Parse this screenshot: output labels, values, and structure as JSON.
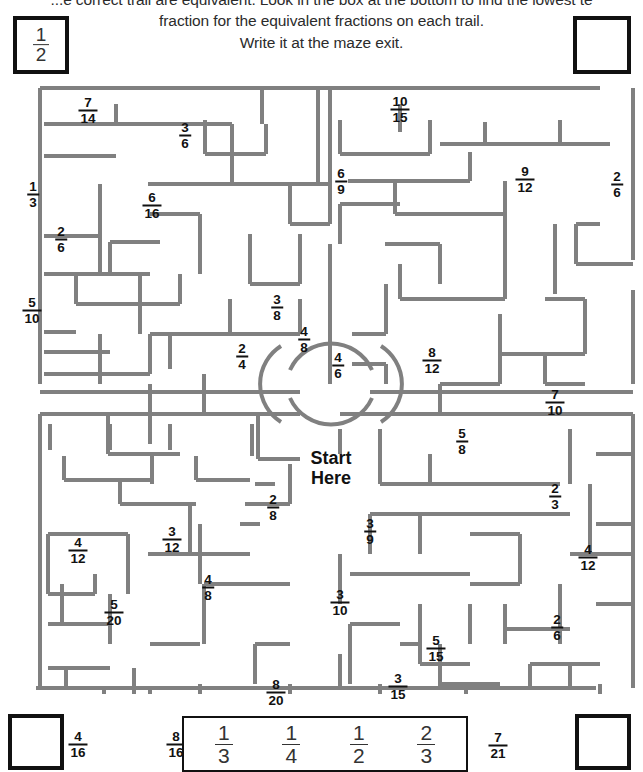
{
  "instructions": {
    "line1": "...e correct trail are equivalent. Look in the box at the bottom to find the lowest te",
    "line2": "fraction for the equivalent fractions on each trail.",
    "line3": "Write it at the maze exit."
  },
  "key_box": {
    "numerator": "1",
    "denominator": "2"
  },
  "empty_boxes": {
    "top_right": "",
    "bottom_left": "",
    "bottom_right": ""
  },
  "start_marker": {
    "line1": "Start",
    "line2": "Here"
  },
  "answer_bank": {
    "options": [
      {
        "numerator": "1",
        "denominator": "3"
      },
      {
        "numerator": "1",
        "denominator": "4"
      },
      {
        "numerator": "1",
        "denominator": "2"
      },
      {
        "numerator": "2",
        "denominator": "3"
      }
    ]
  },
  "colors": {
    "wall": "#808080",
    "border": "#111111",
    "text": "#1a1a1a"
  },
  "maze_fractions": [
    {
      "numerator": "7",
      "denominator": "14",
      "x": 88,
      "y": 26,
      "quadrant": "top-left"
    },
    {
      "numerator": "3",
      "denominator": "6",
      "x": 185,
      "y": 51,
      "quadrant": "top-left"
    },
    {
      "numerator": "1",
      "denominator": "3",
      "x": 33,
      "y": 110,
      "quadrant": "top-left"
    },
    {
      "numerator": "6",
      "denominator": "16",
      "x": 152,
      "y": 121,
      "quadrant": "top-left"
    },
    {
      "numerator": "2",
      "denominator": "6",
      "x": 61,
      "y": 155,
      "quadrant": "top-left"
    },
    {
      "numerator": "4",
      "denominator": "8",
      "x": 304,
      "y": 255,
      "quadrant": "top-left"
    },
    {
      "numerator": "5",
      "denominator": "10",
      "x": 32,
      "y": 226,
      "quadrant": "top-left"
    },
    {
      "numerator": "3",
      "denominator": "8",
      "x": 277,
      "y": 223,
      "quadrant": "top-left"
    },
    {
      "numerator": "2",
      "denominator": "4",
      "x": 242,
      "y": 272,
      "quadrant": "top-left"
    },
    {
      "numerator": "10",
      "denominator": "15",
      "x": 400,
      "y": 25,
      "quadrant": "top-right"
    },
    {
      "numerator": "6",
      "denominator": "9",
      "x": 341,
      "y": 97,
      "quadrant": "top-right"
    },
    {
      "numerator": "9",
      "denominator": "12",
      "x": 525,
      "y": 95,
      "quadrant": "top-right"
    },
    {
      "numerator": "2",
      "denominator": "6",
      "x": 617,
      "y": 100,
      "quadrant": "top-right"
    },
    {
      "numerator": "4",
      "denominator": "6",
      "x": 338,
      "y": 281,
      "quadrant": "top-right"
    },
    {
      "numerator": "8",
      "denominator": "12",
      "x": 432,
      "y": 276,
      "quadrant": "top-right"
    },
    {
      "numerator": "7",
      "denominator": "10",
      "x": 555,
      "y": 318,
      "quadrant": "top-right"
    },
    {
      "numerator": "5",
      "denominator": "8",
      "x": 462,
      "y": 357,
      "quadrant": "top-right"
    },
    {
      "numerator": "2",
      "denominator": "8",
      "x": 273,
      "y": 423,
      "quadrant": "bottom-left"
    },
    {
      "numerator": "3",
      "denominator": "12",
      "x": 172,
      "y": 455,
      "quadrant": "bottom-left"
    },
    {
      "numerator": "4",
      "denominator": "12",
      "x": 78,
      "y": 466,
      "quadrant": "bottom-left"
    },
    {
      "numerator": "4",
      "denominator": "8",
      "x": 208,
      "y": 503,
      "quadrant": "bottom-left"
    },
    {
      "numerator": "5",
      "denominator": "20",
      "x": 114,
      "y": 528,
      "quadrant": "bottom-left"
    },
    {
      "numerator": "8",
      "denominator": "20",
      "x": 276,
      "y": 608,
      "quadrant": "bottom-left"
    },
    {
      "numerator": "4",
      "denominator": "16",
      "x": 78,
      "y": 660,
      "quadrant": "bottom-left"
    },
    {
      "numerator": "8",
      "denominator": "16",
      "x": 176,
      "y": 660,
      "quadrant": "bottom-left"
    },
    {
      "numerator": "2",
      "denominator": "3",
      "x": 555,
      "y": 412,
      "quadrant": "bottom-right"
    },
    {
      "numerator": "3",
      "denominator": "9",
      "x": 370,
      "y": 447,
      "quadrant": "bottom-right"
    },
    {
      "numerator": "4",
      "denominator": "12",
      "x": 588,
      "y": 473,
      "quadrant": "bottom-right"
    },
    {
      "numerator": "3",
      "denominator": "10",
      "x": 340,
      "y": 518,
      "quadrant": "bottom-right"
    },
    {
      "numerator": "2",
      "denominator": "6",
      "x": 557,
      "y": 543,
      "quadrant": "bottom-right"
    },
    {
      "numerator": "5",
      "denominator": "15",
      "x": 436,
      "y": 564,
      "quadrant": "bottom-right"
    },
    {
      "numerator": "3",
      "denominator": "15",
      "x": 398,
      "y": 602,
      "quadrant": "bottom-right"
    },
    {
      "numerator": "9",
      "denominator": "18",
      "x": 340,
      "y": 661,
      "quadrant": "bottom-right"
    },
    {
      "numerator": "7",
      "denominator": "21",
      "x": 498,
      "y": 661,
      "quadrant": "bottom-right"
    }
  ],
  "maze_walls": {
    "stroke_width": 4,
    "segments": [
      [
        40,
        4,
        40,
        300
      ],
      [
        40,
        330,
        40,
        604
      ],
      [
        40,
        4,
        600,
        4
      ],
      [
        36,
        604,
        596,
        604
      ],
      [
        633,
        4,
        633,
        176
      ],
      [
        633,
        206,
        633,
        300
      ],
      [
        633,
        330,
        633,
        604
      ],
      [
        40,
        308,
        300,
        308
      ],
      [
        370,
        308,
        633,
        308
      ],
      [
        44,
        40,
        232,
        40
      ],
      [
        44,
        72,
        116,
        72
      ],
      [
        232,
        40,
        232,
        100
      ],
      [
        148,
        100,
        330,
        100
      ],
      [
        116,
        40,
        116,
        20
      ],
      [
        318,
        4,
        318,
        100
      ],
      [
        330,
        4,
        330,
        48
      ],
      [
        400,
        20,
        400,
        48
      ],
      [
        100,
        100,
        100,
        190
      ],
      [
        262,
        4,
        262,
        40
      ],
      [
        266,
        40,
        266,
        70
      ],
      [
        205,
        70,
        266,
        70
      ],
      [
        205,
        36,
        205,
        70
      ],
      [
        340,
        36,
        340,
        70
      ],
      [
        340,
        70,
        430,
        70
      ],
      [
        430,
        36,
        430,
        70
      ],
      [
        485,
        38,
        485,
        60
      ],
      [
        440,
        60,
        560,
        60
      ],
      [
        560,
        36,
        560,
        60
      ],
      [
        560,
        60,
        610,
        60
      ],
      [
        200,
        130,
        200,
        190
      ],
      [
        150,
        130,
        200,
        130
      ],
      [
        44,
        152,
        100,
        152
      ],
      [
        44,
        190,
        150,
        190
      ],
      [
        110,
        158,
        160,
        158
      ],
      [
        110,
        158,
        110,
        190
      ],
      [
        76,
        190,
        76,
        220
      ],
      [
        76,
        220,
        180,
        220
      ],
      [
        180,
        190,
        180,
        220
      ],
      [
        140,
        190,
        140,
        250
      ],
      [
        150,
        250,
        230,
        250
      ],
      [
        44,
        248,
        76,
        248
      ],
      [
        44,
        290,
        150,
        290
      ],
      [
        150,
        250,
        150,
        290
      ],
      [
        230,
        215,
        230,
        250
      ],
      [
        230,
        250,
        300,
        250
      ],
      [
        170,
        250,
        170,
        285
      ],
      [
        100,
        250,
        100,
        300
      ],
      [
        300,
        215,
        300,
        250
      ],
      [
        44,
        268,
        110,
        268
      ],
      [
        44,
        330,
        150,
        330
      ],
      [
        150,
        300,
        150,
        360
      ],
      [
        204,
        290,
        204,
        330
      ],
      [
        204,
        330,
        300,
        330
      ],
      [
        258,
        330,
        258,
        375
      ],
      [
        258,
        375,
        300,
        375
      ],
      [
        108,
        330,
        108,
        370
      ],
      [
        108,
        370,
        180,
        370
      ],
      [
        300,
        150,
        300,
        200
      ],
      [
        250,
        200,
        300,
        200
      ],
      [
        250,
        150,
        250,
        200
      ],
      [
        330,
        48,
        330,
        140
      ],
      [
        330,
        140,
        290,
        140
      ],
      [
        290,
        100,
        290,
        140
      ],
      [
        348,
        97,
        470,
        97
      ],
      [
        470,
        68,
        470,
        97
      ],
      [
        395,
        97,
        395,
        130
      ],
      [
        395,
        130,
        505,
        130
      ],
      [
        505,
        97,
        505,
        130
      ],
      [
        505,
        130,
        505,
        215
      ],
      [
        400,
        215,
        505,
        215
      ],
      [
        400,
        180,
        400,
        215
      ],
      [
        440,
        160,
        440,
        200
      ],
      [
        340,
        120,
        400,
        120
      ],
      [
        340,
        120,
        340,
        160
      ],
      [
        385,
        160,
        440,
        160
      ],
      [
        330,
        160,
        330,
        250
      ],
      [
        352,
        250,
        386,
        250
      ],
      [
        386,
        200,
        386,
        250
      ],
      [
        330,
        250,
        330,
        300
      ],
      [
        386,
        280,
        386,
        300
      ],
      [
        352,
        280,
        386,
        280
      ],
      [
        500,
        230,
        500,
        300
      ],
      [
        440,
        300,
        500,
        300
      ],
      [
        440,
        300,
        440,
        330
      ],
      [
        555,
        140,
        555,
        210
      ],
      [
        576,
        140,
        600,
        140
      ],
      [
        576,
        140,
        576,
        180
      ],
      [
        600,
        180,
        633,
        180
      ],
      [
        576,
        180,
        633,
        180
      ],
      [
        545,
        215,
        585,
        215
      ],
      [
        585,
        215,
        585,
        270
      ],
      [
        500,
        270,
        585,
        270
      ],
      [
        545,
        300,
        585,
        300
      ],
      [
        545,
        270,
        545,
        300
      ],
      [
        40,
        330,
        300,
        330
      ],
      [
        50,
        340,
        50,
        366
      ],
      [
        110,
        340,
        110,
        366
      ],
      [
        170,
        340,
        170,
        366
      ],
      [
        64,
        372,
        64,
        396
      ],
      [
        64,
        396,
        150,
        396
      ],
      [
        152,
        372,
        152,
        400
      ],
      [
        196,
        372,
        196,
        396
      ],
      [
        196,
        396,
        250,
        396
      ],
      [
        120,
        420,
        196,
        420
      ],
      [
        120,
        396,
        120,
        420
      ],
      [
        252,
        340,
        252,
        372
      ],
      [
        190,
        420,
        190,
        470
      ],
      [
        128,
        450,
        128,
        510
      ],
      [
        48,
        450,
        128,
        450
      ],
      [
        48,
        450,
        48,
        510
      ],
      [
        48,
        510,
        95,
        510
      ],
      [
        95,
        490,
        95,
        510
      ],
      [
        190,
        470,
        250,
        470
      ],
      [
        148,
        470,
        190,
        470
      ],
      [
        62,
        500,
        62,
        540
      ],
      [
        48,
        540,
        110,
        540
      ],
      [
        110,
        510,
        110,
        560
      ],
      [
        240,
        440,
        260,
        440
      ],
      [
        200,
        440,
        200,
        500
      ],
      [
        255,
        400,
        275,
        400
      ],
      [
        245,
        420,
        290,
        420
      ],
      [
        290,
        380,
        290,
        420
      ],
      [
        204,
        500,
        290,
        500
      ],
      [
        204,
        500,
        204,
        560
      ],
      [
        255,
        560,
        290,
        560
      ],
      [
        255,
        560,
        255,
        600
      ],
      [
        150,
        560,
        200,
        560
      ],
      [
        48,
        584,
        110,
        584
      ],
      [
        66,
        584,
        66,
        604
      ],
      [
        134,
        584,
        134,
        620
      ],
      [
        134,
        620,
        200,
        620
      ],
      [
        200,
        600,
        200,
        640
      ],
      [
        48,
        625,
        100,
        625
      ],
      [
        156,
        640,
        200,
        640
      ],
      [
        104,
        640,
        104,
        604
      ],
      [
        245,
        630,
        300,
        630
      ],
      [
        150,
        640,
        150,
        604
      ],
      [
        290,
        600,
        290,
        640
      ],
      [
        340,
        330,
        633,
        330
      ],
      [
        340,
        345,
        340,
        370
      ],
      [
        380,
        345,
        380,
        400
      ],
      [
        380,
        400,
        560,
        400
      ],
      [
        430,
        370,
        430,
        400
      ],
      [
        570,
        345,
        570,
        400
      ],
      [
        596,
        370,
        633,
        370
      ],
      [
        370,
        430,
        570,
        430
      ],
      [
        370,
        430,
        370,
        470
      ],
      [
        590,
        400,
        590,
        470
      ],
      [
        420,
        430,
        420,
        470
      ],
      [
        470,
        450,
        520,
        450
      ],
      [
        520,
        450,
        520,
        500
      ],
      [
        470,
        500,
        520,
        500
      ],
      [
        430,
        490,
        470,
        490
      ],
      [
        340,
        470,
        340,
        520
      ],
      [
        350,
        490,
        430,
        490
      ],
      [
        596,
        440,
        633,
        440
      ],
      [
        570,
        470,
        633,
        470
      ],
      [
        420,
        520,
        420,
        580
      ],
      [
        470,
        520,
        470,
        560
      ],
      [
        505,
        545,
        570,
        545
      ],
      [
        505,
        520,
        505,
        560
      ],
      [
        560,
        500,
        560,
        560
      ],
      [
        420,
        580,
        470,
        580
      ],
      [
        400,
        560,
        420,
        560
      ],
      [
        350,
        540,
        400,
        540
      ],
      [
        350,
        540,
        350,
        600
      ],
      [
        440,
        600,
        500,
        600
      ],
      [
        440,
        560,
        440,
        604
      ],
      [
        530,
        580,
        600,
        580
      ],
      [
        530,
        580,
        530,
        604
      ],
      [
        596,
        520,
        633,
        520
      ],
      [
        570,
        604,
        570,
        580
      ],
      [
        380,
        620,
        440,
        620
      ],
      [
        380,
        600,
        380,
        640
      ],
      [
        340,
        604,
        340,
        570
      ],
      [
        466,
        604,
        466,
        640
      ],
      [
        500,
        640,
        560,
        640
      ],
      [
        600,
        620,
        633,
        620
      ],
      [
        600,
        600,
        600,
        640
      ]
    ]
  }
}
